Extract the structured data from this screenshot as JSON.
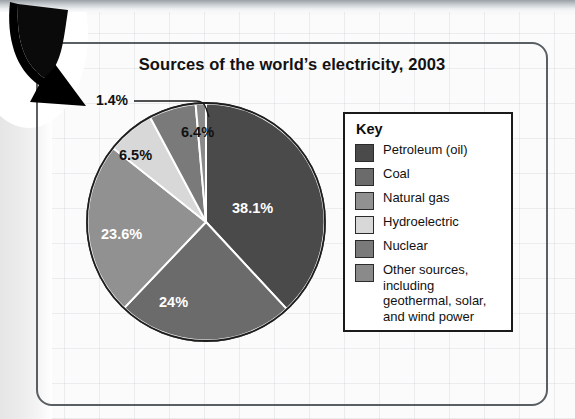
{
  "figure": {
    "title": "Sources of the world’s electricity, 2003"
  },
  "legend": {
    "title": "Key",
    "entries": [
      {
        "label": "Petroleum (oil)",
        "color": "#4a4a4a"
      },
      {
        "label": "Coal",
        "color": "#6b6b6b"
      },
      {
        "label": "Natural gas",
        "color": "#919191"
      },
      {
        "label": "Hydroelectric",
        "color": "#d8d8d8"
      },
      {
        "label": "Nuclear",
        "color": "#7a7a7a"
      },
      {
        "label": "Other sources, including geothermal, solar, and wind power",
        "color": "#8a8a8a"
      }
    ]
  },
  "callout": {
    "label": "1.4%"
  },
  "chart_data": {
    "type": "pie",
    "title": "Sources of the world’s electricity, 2003",
    "xlabel": "",
    "ylabel": "",
    "units": "percent",
    "total": 100,
    "start_angle_deg": 0,
    "direction": "clockwise",
    "legend_position": "right",
    "grid": false,
    "labels": [
      "Petroleum (oil)",
      "Coal",
      "Natural gas",
      "Hydroelectric",
      "Nuclear",
      "Other sources, including geothermal, solar, and wind power"
    ],
    "values": [
      38.1,
      24,
      23.6,
      6.5,
      6.4,
      1.4
    ],
    "value_labels": [
      "38.1%",
      "24%",
      "23.6%",
      "6.5%",
      "6.4%",
      "1.4%"
    ],
    "colors": [
      "#4a4a4a",
      "#6b6b6b",
      "#919191",
      "#d8d8d8",
      "#7a7a7a",
      "#8a8a8a"
    ],
    "slice_label_placement": [
      "inside",
      "inside",
      "inside",
      "inside",
      "inside",
      "callout"
    ]
  }
}
